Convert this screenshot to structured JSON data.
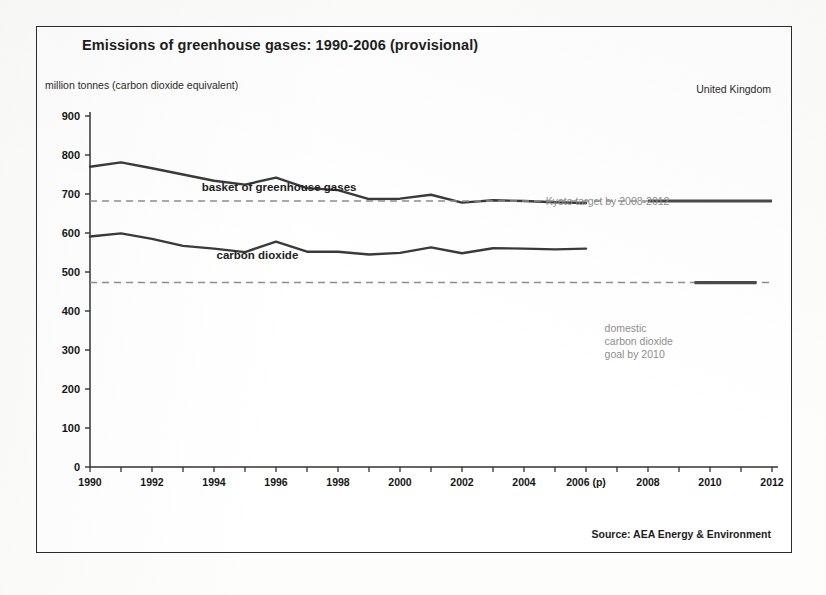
{
  "page": {
    "background_color": "#fdfdfc",
    "frame_border_color": "#2b2b2b"
  },
  "header": {
    "title": "Emissions of greenhouse gases: 1990-2006 (provisional)",
    "unit_label": "million tonnes (carbon dioxide equivalent)",
    "region_label": "United Kingdom"
  },
  "footer": {
    "source": "Source: AEA Energy & Environment"
  },
  "annotations": {
    "basket_series_label": "basket of greenhouse gases",
    "co2_series_label": "carbon dioxide",
    "kyoto_label": "Kyoto target by 2008-2012",
    "domestic_goal_label": "domestic\ncarbon dioxide\ngoal by 2010"
  },
  "chart_data": {
    "type": "line",
    "title": "Emissions of greenhouse gases: 1990-2006 (provisional)",
    "xlabel": "",
    "ylabel": "million tonnes (carbon dioxide equivalent)",
    "xlim": [
      1990,
      2012
    ],
    "ylim": [
      0,
      900
    ],
    "ytick_step": 100,
    "yticks": [
      0,
      100,
      200,
      300,
      400,
      500,
      600,
      700,
      800,
      900
    ],
    "xticks": [
      1990,
      1991,
      1992,
      1993,
      1994,
      1995,
      1996,
      1997,
      1998,
      1999,
      2000,
      2001,
      2002,
      2003,
      2004,
      2005,
      2006,
      2007,
      2008,
      2009,
      2010,
      2011,
      2012
    ],
    "xtick_labels": [
      "1990",
      "",
      "1992",
      "",
      "1994",
      "",
      "1996",
      "",
      "1998",
      "",
      "2000",
      "",
      "2002",
      "",
      "2004",
      "",
      "2006 (p)",
      "",
      "2008",
      "",
      "2010",
      "",
      "2012"
    ],
    "grid": false,
    "legend_position": "inline-annotations",
    "series": [
      {
        "name": "basket of greenhouse gases",
        "color": "#3a3a3a",
        "style": "solid",
        "x": [
          1990,
          1991,
          1992,
          1993,
          1994,
          1995,
          1996,
          1997,
          1998,
          1999,
          2000,
          2001,
          2002,
          2003,
          2004,
          2005,
          2006
        ],
        "values": [
          770,
          781,
          766,
          750,
          734,
          724,
          742,
          715,
          710,
          687,
          688,
          698,
          678,
          684,
          682,
          679,
          677
        ]
      },
      {
        "name": "carbon dioxide",
        "color": "#3a3a3a",
        "style": "solid",
        "x": [
          1990,
          1991,
          1992,
          1993,
          1994,
          1995,
          1996,
          1997,
          1998,
          1999,
          2000,
          2001,
          2002,
          2003,
          2004,
          2005,
          2006
        ],
        "values": [
          591,
          599,
          585,
          567,
          560,
          551,
          578,
          552,
          552,
          545,
          549,
          563,
          548,
          561,
          560,
          558,
          560
        ]
      },
      {
        "name": "Kyoto target by 2008-2012",
        "color": "#8e8e8e",
        "style": "dashed",
        "constant_value": 682,
        "x": [
          1990,
          2012
        ],
        "values": [
          682,
          682
        ],
        "solid_segment_x": [
          2008,
          2012
        ]
      },
      {
        "name": "domestic carbon dioxide goal by 2010",
        "color": "#8e8e8e",
        "style": "dashed",
        "constant_value": 473,
        "x": [
          1990,
          2012
        ],
        "values": [
          473,
          473
        ],
        "solid_segment_x": [
          2009.5,
          2011.5
        ]
      }
    ]
  }
}
